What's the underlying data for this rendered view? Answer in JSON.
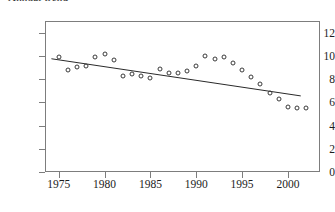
{
  "title_fragment": "Annual trend",
  "colors": {
    "axis": "#7d7d7d",
    "marker": "#3a3a3a",
    "trend_line": "#2a2a2a",
    "background": "#ffffff",
    "text": "#1c1c1c"
  },
  "axes": {
    "y_ticks": [
      0,
      2,
      4,
      6,
      8,
      10,
      12
    ],
    "x_ticks": [
      1975,
      1980,
      1985,
      1990,
      1995,
      2000
    ],
    "ylim": [
      0,
      13
    ],
    "xlim": [
      1973.5,
      2003.5
    ]
  },
  "chart_data": {
    "type": "scatter",
    "title": "",
    "subtitle": "",
    "xlabel": "",
    "ylabel": "",
    "xlim": [
      1973.5,
      2003.5
    ],
    "ylim": [
      0,
      13
    ],
    "grid": false,
    "legend": "none",
    "marker_style": "open-circle",
    "x": [
      1975,
      1976,
      1977,
      1978,
      1979,
      1980,
      1981,
      1982,
      1983,
      1984,
      1985,
      1986,
      1987,
      1988,
      1989,
      1990,
      1991,
      1992,
      1993,
      1994,
      1995,
      1996,
      1997,
      1998,
      1999,
      2000,
      2001,
      2002
    ],
    "y": [
      9.9,
      8.8,
      9.0,
      9.1,
      9.9,
      10.2,
      9.6,
      8.3,
      8.4,
      8.3,
      8.1,
      8.9,
      8.5,
      8.5,
      8.7,
      9.1,
      10.0,
      9.7,
      9.9,
      9.4,
      8.8,
      8.2,
      7.6,
      6.8,
      6.3,
      5.6,
      5.5,
      5.5
    ],
    "series": [
      {
        "name": "observations",
        "values": [
          9.9,
          8.8,
          9.0,
          9.1,
          9.9,
          10.2,
          9.6,
          8.3,
          8.4,
          8.3,
          8.1,
          8.9,
          8.5,
          8.5,
          8.7,
          9.1,
          10.0,
          9.7,
          9.9,
          9.4,
          8.8,
          8.2,
          7.6,
          6.8,
          6.3,
          5.6,
          5.5,
          5.5
        ]
      }
    ],
    "annotations": [
      {
        "type": "trend-line",
        "name": "linear-regression-line",
        "x_start": 1974.2,
        "y_start": 9.75,
        "x_end": 2001.4,
        "y_end": 6.55
      }
    ]
  }
}
